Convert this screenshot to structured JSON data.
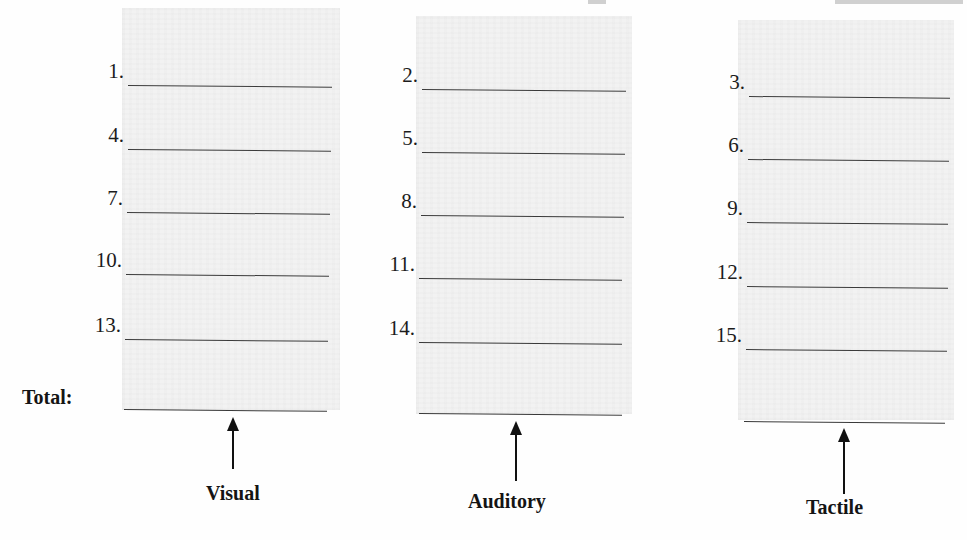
{
  "worksheet": {
    "total_label": "Total:",
    "columns": [
      {
        "id": "visual",
        "label": "Visual",
        "items": [
          "1.",
          "4.",
          "7.",
          "10.",
          "13."
        ],
        "total_value": ""
      },
      {
        "id": "auditory",
        "label": "Auditory",
        "items": [
          "2.",
          "5.",
          "8.",
          "11.",
          "14."
        ],
        "total_value": ""
      },
      {
        "id": "tactile",
        "label": "Tactile",
        "items": [
          "3.",
          "6.",
          "9.",
          "12.",
          "15."
        ],
        "total_value": ""
      }
    ]
  },
  "colors": {
    "column_shade": "#f2f2f2",
    "line": "#3a3a3a",
    "text": "#1a1a1a"
  }
}
